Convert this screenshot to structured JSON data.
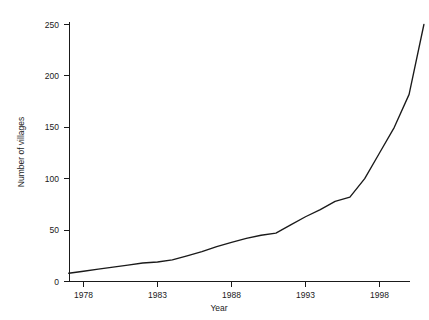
{
  "chart_data": {
    "type": "line",
    "title": "",
    "xlabel": "Year",
    "ylabel": "Number of villages",
    "xlim": [
      1977,
      2001
    ],
    "ylim": [
      0,
      250
    ],
    "xticks": [
      1978,
      1983,
      1988,
      1993,
      1998
    ],
    "xtick_labels": [
      "1978",
      "1983",
      "1988",
      "1993",
      "1998"
    ],
    "yticks": [
      0,
      50,
      100,
      150,
      200,
      250
    ],
    "ytick_labels": [
      "0",
      "50",
      "100",
      "150",
      "200",
      "250"
    ],
    "grid": false,
    "legend": false,
    "line_color": "#1a1a1a",
    "series": [
      {
        "name": "Number of villages",
        "x": [
          1977,
          1978,
          1979,
          1980,
          1981,
          1982,
          1983,
          1984,
          1985,
          1986,
          1987,
          1988,
          1989,
          1990,
          1991,
          1992,
          1993,
          1994,
          1995,
          1996,
          1997,
          1998,
          1999,
          2000,
          2001
        ],
        "values": [
          8,
          10,
          12,
          14,
          16,
          18,
          19,
          21,
          25,
          29,
          34,
          38,
          42,
          45,
          47,
          55,
          63,
          70,
          78,
          82,
          100,
          125,
          150,
          182,
          250
        ]
      }
    ]
  },
  "axes": {
    "y_axis_title": "Number of villages",
    "x_axis_title": "Year"
  }
}
